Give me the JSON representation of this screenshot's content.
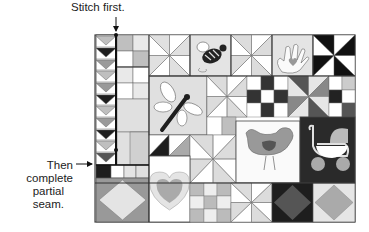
{
  "annotations": {
    "top_label": "Stitch first.",
    "left_label_line1": "Then complete",
    "left_label_line2": "partial seam."
  },
  "colors": {
    "light": "#e9e9e9",
    "mid": "#bfbfbf",
    "midDark": "#9a9a9a",
    "dark": "#555555",
    "black": "#1e1e1e",
    "white": "#ffffff",
    "line": "#444444"
  },
  "quilt": {
    "description": "Sampler quilt layout with flying geese column, pinwheels, nine-patches, and appliqué blocks (bee, hand, dragonfly, heart, bird, baby carriage)",
    "blocks": [
      "flying-geese-column",
      "four-patch-top-left",
      "pinwheel-light-top",
      "bee-applique",
      "pinwheel-top-middle",
      "hand-heart-applique",
      "pinwheel-black",
      "dragonfly-applique",
      "pinwheel-middle",
      "nine-patch-dark",
      "pinwheel-gray",
      "nine-patch-right",
      "half-square-triangles",
      "pinwheel-lower",
      "bird-applique",
      "baby-carriage-applique",
      "diamond-in-square-left",
      "heart-applique",
      "four-patch-bottom",
      "pinwheel-bottom",
      "diamond-dark",
      "diamond-light"
    ]
  }
}
